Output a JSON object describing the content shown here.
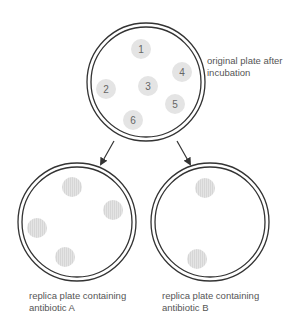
{
  "colors": {
    "ring": "#333333",
    "colony_fill": "#e4e4e4",
    "colony_stripe": "#d6d6d6",
    "number_text": "#666666",
    "label_text": "#555555"
  },
  "original_plate": {
    "cx": 146,
    "cy": 82,
    "r_outer": 59,
    "r_inner": 55,
    "label_lines": [
      "original plate after",
      "incubation"
    ],
    "colonies": [
      {
        "number": "1",
        "cx": 141,
        "cy": 49
      },
      {
        "number": "2",
        "cx": 106,
        "cy": 89
      },
      {
        "number": "3",
        "cx": 148,
        "cy": 86
      },
      {
        "number": "4",
        "cx": 182,
        "cy": 72
      },
      {
        "number": "5",
        "cx": 175,
        "cy": 104
      },
      {
        "number": "6",
        "cx": 133,
        "cy": 120
      }
    ]
  },
  "arrows": [
    {
      "x1": 114,
      "y1": 141,
      "x2": 101,
      "y2": 164
    },
    {
      "x1": 177,
      "y1": 141,
      "x2": 190,
      "y2": 164
    }
  ],
  "replica_a": {
    "cx": 77,
    "cy": 222,
    "r_outer": 59,
    "r_inner": 55,
    "label_lines": [
      "replica plate containing",
      "antibiotic A"
    ],
    "colonies": [
      {
        "cx": 72,
        "cy": 187
      },
      {
        "cx": 113,
        "cy": 210
      },
      {
        "cx": 37,
        "cy": 228
      },
      {
        "cx": 65,
        "cy": 257
      }
    ]
  },
  "replica_b": {
    "cx": 210,
    "cy": 222,
    "r_outer": 59,
    "r_inner": 55,
    "label_lines": [
      "replica plate containing",
      "antibiotic B"
    ],
    "colonies": [
      {
        "cx": 205,
        "cy": 188
      },
      {
        "cx": 197,
        "cy": 259
      }
    ]
  }
}
